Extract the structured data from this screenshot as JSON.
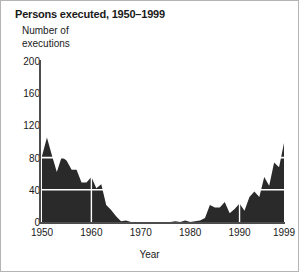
{
  "figure": {
    "title": "Persons executed, 1950–1999",
    "border_color": "#b4b4b4",
    "background": "#ffffff"
  },
  "chart_data": {
    "type": "area",
    "title": "Persons executed, 1950–1999",
    "xlabel": "Year",
    "ylabel": "Number of executions",
    "ylabel_lines": [
      "Number of",
      "executions"
    ],
    "xlim": [
      1950,
      1999
    ],
    "ylim": [
      0,
      200
    ],
    "yticks": [
      0,
      40,
      80,
      120,
      160,
      200
    ],
    "ytick_labels": [
      "0",
      "40",
      "80",
      "120",
      "160",
      "200"
    ],
    "xticks": [
      1950,
      1960,
      1970,
      1980,
      1990,
      1999
    ],
    "xtick_labels": [
      "1950",
      "1960",
      "1970",
      "1980",
      "1990",
      "1999"
    ],
    "grid": "white gridlines over fill at y=40 and y=80; white vertical ticks at 1960 and 1990",
    "gridline_color": "#ffffff",
    "fill_color": "#2a2a2a",
    "axis_color": "#4d4d4d",
    "legend": "none",
    "x": [
      1950,
      1951,
      1952,
      1953,
      1954,
      1955,
      1956,
      1957,
      1958,
      1959,
      1960,
      1961,
      1962,
      1963,
      1964,
      1965,
      1966,
      1967,
      1968,
      1969,
      1970,
      1971,
      1972,
      1973,
      1974,
      1975,
      1976,
      1977,
      1978,
      1979,
      1980,
      1981,
      1982,
      1983,
      1984,
      1985,
      1986,
      1987,
      1988,
      1989,
      1990,
      1991,
      1992,
      1993,
      1994,
      1995,
      1996,
      1997,
      1998,
      1999
    ],
    "values": [
      82,
      105,
      83,
      62,
      81,
      76,
      65,
      65,
      49,
      49,
      56,
      42,
      47,
      21,
      15,
      7,
      1,
      2,
      0,
      0,
      0,
      0,
      0,
      0,
      0,
      0,
      0,
      1,
      0,
      2,
      0,
      1,
      2,
      5,
      21,
      18,
      18,
      25,
      11,
      16,
      23,
      14,
      31,
      38,
      31,
      56,
      45,
      74,
      68,
      98
    ],
    "series": [
      {
        "name": "Number of executions",
        "values": [
          82,
          105,
          83,
          62,
          81,
          76,
          65,
          65,
          49,
          49,
          56,
          42,
          47,
          21,
          15,
          7,
          1,
          2,
          0,
          0,
          0,
          0,
          0,
          0,
          0,
          0,
          0,
          1,
          0,
          2,
          0,
          1,
          2,
          5,
          21,
          18,
          18,
          25,
          11,
          16,
          23,
          14,
          31,
          38,
          31,
          56,
          45,
          74,
          68,
          98
        ]
      }
    ]
  }
}
